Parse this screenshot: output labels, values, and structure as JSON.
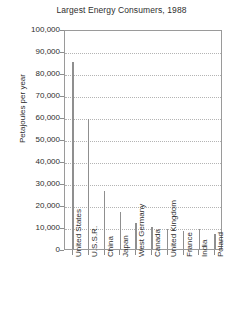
{
  "chart_data": {
    "type": "bar",
    "title": "Largest Energy Consumers, 1988",
    "xlabel": "",
    "ylabel": "Petajoules per year",
    "ylim": [
      0,
      100000
    ],
    "ytick_labels": [
      "100,000",
      "90,000",
      "80,000",
      "70,000",
      "60,000",
      "50,000",
      "40,000",
      "30,000",
      "20,000",
      "10,000",
      "0"
    ],
    "ytick_values": [
      100000,
      90000,
      80000,
      70000,
      60000,
      50000,
      40000,
      30000,
      20000,
      10000,
      0
    ],
    "grid": true,
    "legend": "none",
    "categories": [
      "United States",
      "U.S.S.R.",
      "China",
      "Japan",
      "West Germany",
      "Canada",
      "United Kingdom",
      "France",
      "India",
      "Poland"
    ],
    "values": [
      85000,
      59000,
      26500,
      17000,
      12000,
      10000,
      9200,
      8000,
      9300,
      7000
    ],
    "series": [
      {
        "name": "Energy consumption",
        "values": [
          85000,
          59000,
          26500,
          17000,
          12000,
          10000,
          9200,
          8000,
          9300,
          7000
        ]
      }
    ]
  },
  "colors": {
    "bar": "#8f8f8f",
    "axis": "#9a9a9a",
    "grid": "#b4b4b4",
    "text": "#2e2e2e",
    "background": "#ffffff"
  }
}
